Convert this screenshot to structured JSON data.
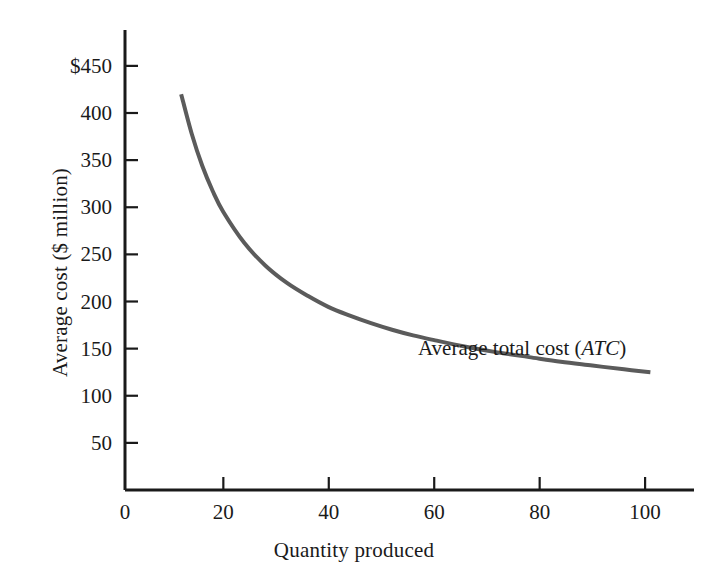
{
  "chart_data": {
    "type": "line",
    "title": "",
    "subtitle": "",
    "xlabel": "Quantity produced",
    "ylabel": "Average cost ($ million)",
    "xlim": [
      0,
      108
    ],
    "ylim": [
      0,
      480
    ],
    "grid": false,
    "legend_position": "inline-annotation",
    "x_ticks": [
      0,
      20,
      40,
      60,
      80,
      100
    ],
    "x_tick_labels": [
      "0",
      "20",
      "40",
      "60",
      "80",
      "100"
    ],
    "y_ticks": [
      50,
      100,
      150,
      200,
      250,
      300,
      350,
      400,
      450
    ],
    "y_tick_labels": [
      "50",
      "100",
      "150",
      "200",
      "250",
      "300",
      "350",
      "400",
      "$450"
    ],
    "series": [
      {
        "name": "Average total cost (ATC)",
        "annotation_prefix": "Average total cost (",
        "annotation_symbol": "ATC",
        "annotation_suffix": ")",
        "color": "#5b5b5b",
        "line_width": 4,
        "x": [
          12,
          14,
          16,
          18,
          20,
          24,
          28,
          32,
          36,
          40,
          44,
          48,
          52,
          56,
          60,
          66,
          72,
          78,
          84,
          90,
          96,
          101
        ],
        "values": [
          420,
          378,
          344,
          317,
          295,
          262,
          238,
          220,
          206,
          194,
          185,
          177,
          170,
          164,
          159,
          152,
          146,
          141,
          136,
          132,
          128,
          125
        ]
      }
    ],
    "axis_color": "#1a1a1a",
    "background": "#ffffff"
  },
  "figure": {
    "x_axis_label": "Quantity produced",
    "y_axis_label": "Average cost ($ million)",
    "origin_label": "0"
  }
}
